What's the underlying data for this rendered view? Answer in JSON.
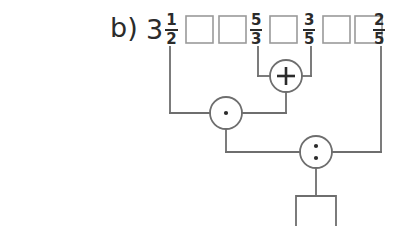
{
  "figure": {
    "label": "b)",
    "type": "arithmetic-expression-tree",
    "background_color": "#ffffff",
    "stroke_color": "#6e6e6e",
    "text_color": "#2b2b2b"
  },
  "top_row": {
    "items": [
      {
        "kind": "mixed-number",
        "whole": "3",
        "numerator": "1",
        "denominator": "2",
        "name": "term-three-and-a-half"
      },
      {
        "kind": "empty-box",
        "value": "",
        "name": "empty-box-1"
      },
      {
        "kind": "empty-box",
        "value": "",
        "name": "empty-box-2"
      },
      {
        "kind": "fraction",
        "numerator": "5",
        "denominator": "3",
        "name": "term-five-thirds"
      },
      {
        "kind": "empty-box",
        "value": "",
        "name": "empty-box-3"
      },
      {
        "kind": "fraction",
        "numerator": "3",
        "denominator": "5",
        "name": "term-three-fifths"
      },
      {
        "kind": "empty-box",
        "value": "",
        "name": "empty-box-4"
      },
      {
        "kind": "empty-box",
        "value": "",
        "name": "empty-box-5"
      },
      {
        "kind": "fraction",
        "numerator": "2",
        "denominator": "5",
        "name": "term-two-fifths"
      }
    ]
  },
  "operators": [
    {
      "name": "plus-operator",
      "symbol": "+",
      "label": "plus",
      "operands": [
        "term-five-thirds",
        "term-three-fifths"
      ]
    },
    {
      "name": "multiply-operator",
      "symbol": "·",
      "label": "times",
      "operands": [
        "term-three-and-a-half",
        "plus-operator"
      ]
    },
    {
      "name": "divide-operator",
      "symbol": ":",
      "label": "divided by",
      "operands": [
        "multiply-operator",
        "term-two-fifths"
      ]
    }
  ],
  "result": {
    "name": "result-box",
    "value": "",
    "placeholder": ""
  }
}
